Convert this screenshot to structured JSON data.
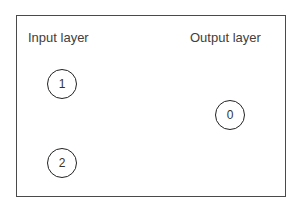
{
  "diagram": {
    "type": "neural-network-layers",
    "labels": {
      "input_layer": "Input layer",
      "output_layer": "Output layer"
    },
    "nodes": [
      {
        "id": "1",
        "label": "1",
        "layer": "input",
        "cx": 62,
        "cy": 84
      },
      {
        "id": "2",
        "label": "2",
        "layer": "input",
        "cx": 62,
        "cy": 163
      },
      {
        "id": "0",
        "label": "0",
        "layer": "output",
        "cx": 230,
        "cy": 115
      }
    ],
    "edges": [],
    "colors": {
      "frame": "#4a4a4a",
      "node_border": "#222222",
      "text": "#404040",
      "background": "#ffffff"
    }
  }
}
